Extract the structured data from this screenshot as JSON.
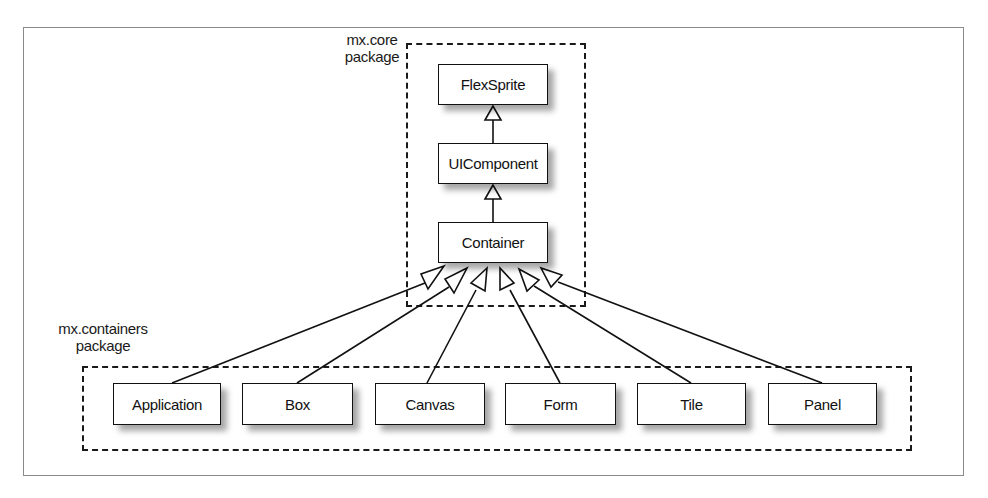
{
  "diagram": {
    "type": "uml-class-inheritance",
    "packages": [
      {
        "id": "mx-core",
        "label_line1": "mx.core",
        "label_line2": "package",
        "classes": [
          "FlexSprite",
          "UIComponent",
          "Container"
        ]
      },
      {
        "id": "mx-containers",
        "label_line1": "mx.containers",
        "label_line2": "package",
        "classes": [
          "Application",
          "Box",
          "Canvas",
          "Form",
          "Tile",
          "Panel"
        ]
      }
    ],
    "classes": {
      "flexsprite": "FlexSprite",
      "uicomponent": "UIComponent",
      "container": "Container",
      "application": "Application",
      "box": "Box",
      "canvas": "Canvas",
      "form": "Form",
      "tile": "Tile",
      "panel": "Panel"
    },
    "edges": [
      {
        "from": "UIComponent",
        "to": "FlexSprite",
        "kind": "generalization"
      },
      {
        "from": "Container",
        "to": "UIComponent",
        "kind": "generalization"
      },
      {
        "from": "Application",
        "to": "Container",
        "kind": "generalization"
      },
      {
        "from": "Box",
        "to": "Container",
        "kind": "generalization"
      },
      {
        "from": "Canvas",
        "to": "Container",
        "kind": "generalization"
      },
      {
        "from": "Form",
        "to": "Container",
        "kind": "generalization"
      },
      {
        "from": "Tile",
        "to": "Container",
        "kind": "generalization"
      },
      {
        "from": "Panel",
        "to": "Container",
        "kind": "generalization"
      }
    ],
    "colors": {
      "line": "#111111",
      "frame": "#8a8a8a",
      "background": "#ffffff"
    }
  }
}
